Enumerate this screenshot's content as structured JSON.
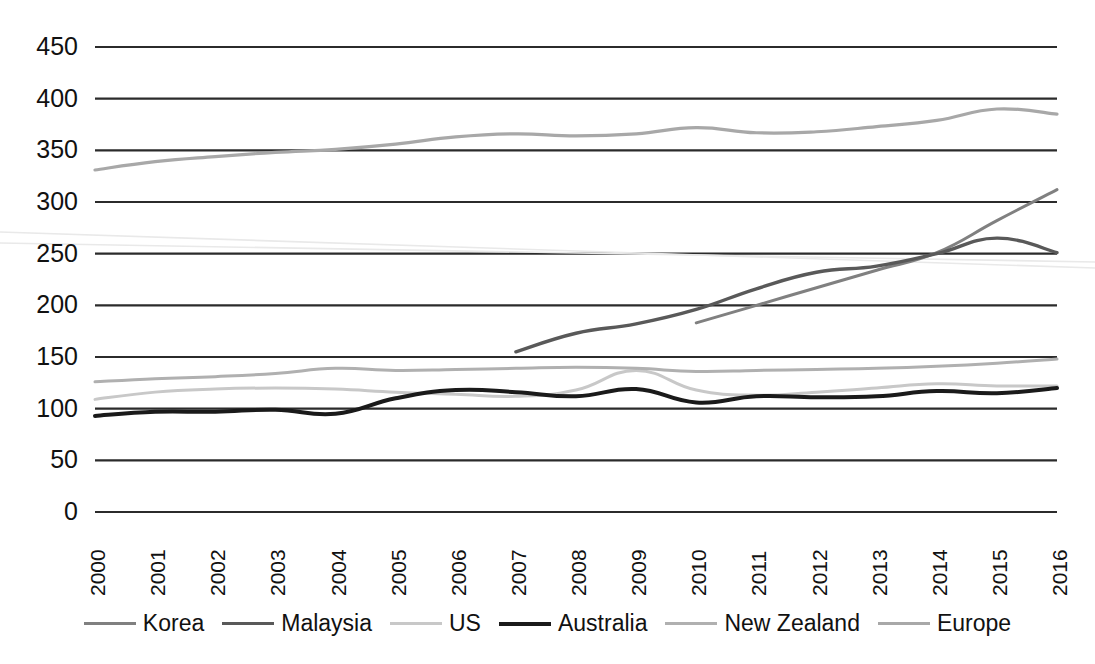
{
  "chart_data": {
    "type": "line",
    "title": "",
    "subtitle": "",
    "xlabel": "",
    "ylabel": "",
    "x": [
      2000,
      2001,
      2002,
      2003,
      2004,
      2005,
      2006,
      2007,
      2008,
      2009,
      2010,
      2011,
      2012,
      2013,
      2014,
      2015,
      2016
    ],
    "categories": [
      "2000",
      "2001",
      "2002",
      "2003",
      "2004",
      "2005",
      "2006",
      "2007",
      "2008",
      "2009",
      "2010",
      "2011",
      "2012",
      "2013",
      "2014",
      "2015",
      "2016"
    ],
    "ylim": [
      0,
      450
    ],
    "yticks": [
      0,
      50,
      100,
      150,
      200,
      250,
      300,
      350,
      400,
      450
    ],
    "ytick_labels": [
      "0",
      "50",
      "100",
      "150",
      "200",
      "250",
      "300",
      "350",
      "400",
      "450"
    ],
    "grid": true,
    "grid_axis": "y",
    "legend_position": "bottom",
    "series": [
      {
        "name": "Korea",
        "color": "#808080",
        "width": 3.0,
        "start_year": 2010,
        "values": [
          null,
          null,
          null,
          null,
          null,
          null,
          null,
          null,
          null,
          null,
          183,
          200,
          217,
          234,
          251,
          282,
          312
        ]
      },
      {
        "name": "Malaysia",
        "color": "#595959",
        "width": 3.4,
        "start_year": 2007,
        "values": [
          null,
          null,
          null,
          null,
          null,
          null,
          null,
          155,
          173,
          182,
          196,
          216,
          232,
          238,
          250,
          265,
          251
        ]
      },
      {
        "name": "US",
        "color": "#c8c8c8",
        "width": 3.0,
        "start_year": 2000,
        "values": [
          109,
          116,
          119,
          120,
          119,
          116,
          114,
          112,
          118,
          137,
          118,
          113,
          116,
          120,
          124,
          122,
          122
        ]
      },
      {
        "name": "Australia",
        "color": "#1a1a1a",
        "width": 4.0,
        "start_year": 2000,
        "values": [
          93,
          97,
          97,
          99,
          95,
          110,
          118,
          116,
          112,
          119,
          106,
          112,
          111,
          112,
          117,
          115,
          120
        ]
      },
      {
        "name": "New Zealand",
        "color": "#b0b0b0",
        "width": 3.0,
        "start_year": 2000,
        "values": [
          126,
          129,
          131,
          134,
          139,
          137,
          138,
          139,
          140,
          139,
          136,
          137,
          138,
          139,
          141,
          144,
          148
        ]
      },
      {
        "name": "Europe",
        "color": "#a8a8a8",
        "width": 3.2,
        "start_year": 2000,
        "values": [
          331,
          339,
          344,
          348,
          351,
          356,
          363,
          366,
          364,
          366,
          372,
          367,
          368,
          373,
          379,
          390,
          385
        ]
      }
    ]
  },
  "legend": {
    "items": [
      {
        "label": "Korea",
        "color": "#808080",
        "width": 3.0
      },
      {
        "label": "Malaysia",
        "color": "#595959",
        "width": 3.6
      },
      {
        "label": "US",
        "color": "#c8c8c8",
        "width": 3.0
      },
      {
        "label": "Australia",
        "color": "#1a1a1a",
        "width": 4.4
      },
      {
        "label": "New Zealand",
        "color": "#b0b0b0",
        "width": 3.0
      },
      {
        "label": "Europe",
        "color": "#a8a8a8",
        "width": 3.0
      }
    ]
  },
  "plot_geometry": {
    "left": 95,
    "right": 1057,
    "top_value_y": 47,
    "bottom_value_y": 512
  }
}
